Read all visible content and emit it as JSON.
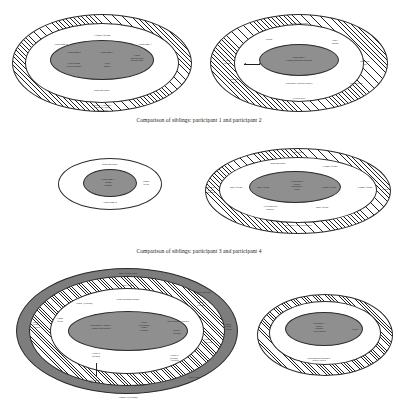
{
  "page": {
    "background_color": "#ffffff",
    "ink_color": "#1a1a1a",
    "grey_fill": "#8f8f8f"
  },
  "captions": {
    "first": "Comparison of siblings: participant 1 and participant 2",
    "second": "Comparison of siblings: participant 3 and participant 4"
  },
  "figures": [
    {
      "id": "figure-1",
      "name": "participant-2-network",
      "labels": {
        "outer_band": "3 female friends",
        "left_ring": "Participant 4",
        "right_ring": "Participant 1",
        "core_left": "Participant 2",
        "core_left_sub": "Other sibling\n& their children",
        "core_centre": "Participant 3",
        "core_centre_sub": "Child\npartner",
        "core_right": "Parent\nMaternal aunt\nPaternal uncle",
        "lower_ring": "Maternal uncle",
        "outer_edge": "Participant 3 , Participant 1\nParticipant 4 , partner,\nSecond cousin"
      }
    },
    {
      "id": "figure-2",
      "name": "participant-1-network",
      "labels": {
        "outer_top": "Second cousin/aunt",
        "left_outer": "2 - male\nfriends",
        "left_lower": "Maternal\nuncle",
        "ring_parent": "Parent",
        "ring_other_sibling": "Other\nsibling",
        "core": "Participant 1\nPartner and their children",
        "inner_lower": "Participant 1 and their partner",
        "right_upper": "Mother-in-\nlaw",
        "right_lower": "Parents-in-law",
        "bottom": "General uncle"
      }
    },
    {
      "id": "figure-3",
      "name": "participant-4-network",
      "labels": {
        "ring_top": "Maternal uncle",
        "core": "Participant 3\nParent\nCousin",
        "right": "Female\nfriend",
        "ring_bottom": "Participant 4"
      }
    },
    {
      "id": "figure-4",
      "name": "participant-3-network",
      "labels": {
        "outer_top": "Male friend",
        "ring_top": "Maternal uncle",
        "ring_top_right": "Female friend",
        "left_outer": "Friends &\nwork\ncolleagues",
        "left_ring": "Male friend",
        "core_left": "Male friend",
        "core_centre": "Participant 4\nPartner\nParticipant 3\nParent",
        "core_right": "Female friend",
        "right_ring": "Female friend",
        "right_outer": "Cousin",
        "inner_lower_left": "All friends seen\nregularly",
        "inner_lower_right": "Male friend",
        "outer_bottom": "Participant 3 and participant 4"
      }
    },
    {
      "id": "figure-5",
      "name": "extended-family-network",
      "labels": {
        "outer_band_top": "Male friend/s plus",
        "ring_top": "Male friend",
        "ring_top_right": "Male friend/s plus",
        "band_top": "Other sibling/s partner",
        "left_ring": "Couple 7 (friends)",
        "left_inner": "Female\nfriend",
        "left_outer": "Couple 8\n(friends)\n+ children",
        "core_left": "Participant 2 + partner +\nchildren and partners",
        "core_centre": "Parent\nParticipants\nFormer\nChildren",
        "core_right": "Other sibling + children",
        "core_right_sub": "Couple 1\n(friends)",
        "right_upper": "Couple 2\n(friends)",
        "right_mid": "Couple 3\n(friends)\n+ children",
        "right_lower": "Couple 4\n(friends)",
        "bottom_left": "Couple 6\n(friends)",
        "bottom_right": "Couple 5\n(friends)\n+ children",
        "bottom_leader_left": "Dead - daughter\nfrom 2 friends",
        "bottom_mid": "Female friend",
        "bottom_right_band": "Female friend",
        "outer_bottom": "Couple 9 (friends)"
      }
    },
    {
      "id": "figure-6",
      "name": "participant-1-family-network",
      "labels": {
        "core": "Participant 1\nPartner\nChildren\n+ their partners",
        "right": "Parent",
        "band_bottom": "Other sibling and participant 2+\npartners / children"
      }
    }
  ]
}
